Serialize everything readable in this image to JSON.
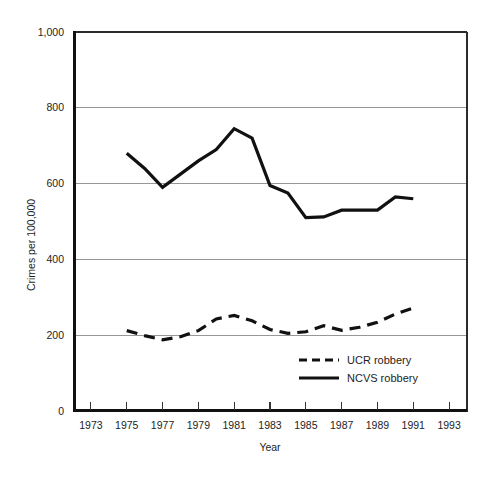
{
  "figure": {
    "background_color": "#ffffff",
    "ink_color": "#111111",
    "grid_color": "#8c8c8c"
  },
  "chart_data": {
    "type": "line",
    "title": "",
    "xlabel": "Year",
    "ylabel": "Crimes per 100,000",
    "xlim": [
      1972,
      1994
    ],
    "ylim": [
      0,
      1000
    ],
    "xticks": [
      1973,
      1975,
      1977,
      1979,
      1981,
      1983,
      1985,
      1987,
      1989,
      1991,
      1993
    ],
    "xtick_labels": [
      "1973",
      "1975",
      "1977",
      "1979",
      "1981",
      "1983",
      "1985",
      "1987",
      "1989",
      "1991",
      "1993"
    ],
    "yticks": [
      0,
      200,
      400,
      600,
      800,
      1000
    ],
    "ytick_labels": [
      "0",
      "200",
      "400",
      "600",
      "800",
      "1,000"
    ],
    "grid": "horizontal",
    "legend_position": "inside-lower-right",
    "series": [
      {
        "name": "UCR robbery",
        "style": "dashed",
        "color": "#111111",
        "x": [
          1975,
          1976,
          1977,
          1978,
          1979,
          1980,
          1981,
          1982,
          1983,
          1984,
          1985,
          1986,
          1987,
          1988,
          1989,
          1990,
          1991
        ],
        "values": [
          212,
          199,
          188,
          196,
          212,
          243,
          252,
          238,
          215,
          205,
          209,
          225,
          213,
          221,
          234,
          256,
          272
        ]
      },
      {
        "name": "NCVS robbery",
        "style": "solid",
        "color": "#111111",
        "x": [
          1975,
          1976,
          1977,
          1978,
          1979,
          1980,
          1981,
          1982,
          1983,
          1984,
          1985,
          1986,
          1987,
          1988,
          1989,
          1990,
          1991
        ],
        "values": [
          680,
          640,
          590,
          625,
          660,
          690,
          745,
          720,
          595,
          575,
          510,
          512,
          530,
          530,
          530,
          565,
          560
        ]
      }
    ]
  },
  "legend": {
    "entries": [
      {
        "label": "UCR robbery",
        "style": "dashed"
      },
      {
        "label": "NCVS robbery",
        "style": "solid"
      }
    ]
  },
  "axis_labels": {
    "x_title": "Year",
    "y_title": "Crimes per 100,000"
  }
}
